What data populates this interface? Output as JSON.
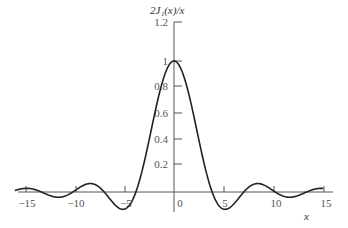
{
  "chart_data": {
    "type": "line",
    "ylabel": "2J1(x)/x",
    "xlabel": "x",
    "xlim": [
      -16,
      15
    ],
    "ylim": [
      -0.14,
      1.2
    ],
    "x_ticks": [
      -15,
      -10,
      -5,
      0,
      5,
      10,
      15
    ],
    "y_ticks": [
      0.2,
      0.4,
      0.6,
      0.8,
      1,
      1.2
    ],
    "x_tick_labels": [
      "-15",
      "-10",
      "-5",
      "0",
      "5",
      "10",
      "15"
    ],
    "y_tick_labels": [
      "0.2",
      "0.4",
      "0.6",
      "0.8",
      "1",
      "1.2"
    ],
    "grid": false,
    "legend": null,
    "series": [
      {
        "name": "2J1(x)/x",
        "function": "2*J1(x)/x",
        "x_range": [
          -16,
          15
        ],
        "key_points": [
          {
            "x": 0,
            "y": 1.0
          },
          {
            "x": 3.83,
            "y": 0.0
          },
          {
            "x": -3.83,
            "y": 0.0
          },
          {
            "x": 5.14,
            "y": -0.132
          },
          {
            "x": -5.14,
            "y": -0.132
          },
          {
            "x": 7.02,
            "y": 0.0
          },
          {
            "x": 8.42,
            "y": 0.064
          },
          {
            "x": -8.42,
            "y": 0.064
          },
          {
            "x": 10.17,
            "y": 0.0
          },
          {
            "x": 11.62,
            "y": -0.04
          },
          {
            "x": -11.62,
            "y": -0.04
          },
          {
            "x": 13.32,
            "y": 0.0
          },
          {
            "x": 14.8,
            "y": 0.028
          },
          {
            "x": -14.8,
            "y": 0.028
          }
        ]
      }
    ],
    "line_color": "#222222"
  },
  "labels": {
    "title": "2J₁(x)/x",
    "xlabel": "x",
    "yticks": [
      "1.2",
      "1",
      "0.8",
      "0.6",
      "0.4",
      "0.2"
    ],
    "xticks": [
      "−15",
      "−10",
      "−5",
      "0",
      "5",
      "10",
      "15"
    ]
  }
}
